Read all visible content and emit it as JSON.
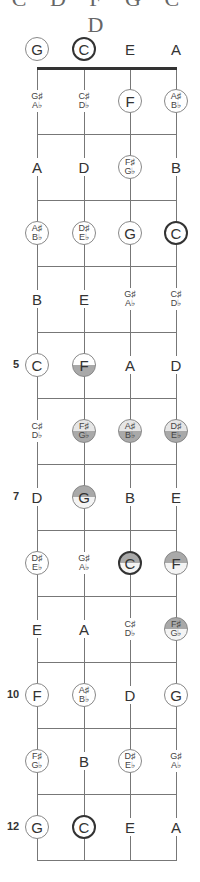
{
  "title": "C D F G C D",
  "tuning": [
    "G",
    "C",
    "E",
    "A"
  ],
  "strings_x": [
    37,
    84,
    130,
    176
  ],
  "nut_y": 68,
  "fret_spacing": 66,
  "fret_numbers": [
    {
      "fret": 5,
      "label": "5"
    },
    {
      "fret": 7,
      "label": "7"
    },
    {
      "fret": 10,
      "label": "10"
    },
    {
      "fret": 12,
      "label": "12"
    }
  ],
  "colors": {
    "line": "#777777",
    "nut": "#333333",
    "fill_dark": "#a9a9a9",
    "fill_light": "#e6e6e6"
  },
  "frets": [
    {
      "fret": 0,
      "notes": [
        {
          "top": "G",
          "circle": "thin",
          "fill": "none"
        },
        {
          "top": "C",
          "circle": "thick",
          "fill": "none"
        },
        {
          "top": "E",
          "circle": "none",
          "fill": "none"
        },
        {
          "top": "A",
          "circle": "none",
          "fill": "none"
        }
      ]
    },
    {
      "fret": 1,
      "notes": [
        {
          "top": "G♯",
          "bottom": "A♭",
          "circle": "none",
          "fill": "none"
        },
        {
          "top": "C♯",
          "bottom": "D♭",
          "circle": "none",
          "fill": "none"
        },
        {
          "top": "F",
          "circle": "thin",
          "fill": "none"
        },
        {
          "top": "A♯",
          "bottom": "B♭",
          "circle": "thin",
          "fill": "none"
        }
      ]
    },
    {
      "fret": 2,
      "notes": [
        {
          "top": "A",
          "circle": "none",
          "fill": "none"
        },
        {
          "top": "D",
          "circle": "none",
          "fill": "none"
        },
        {
          "top": "F♯",
          "bottom": "G♭",
          "circle": "thin",
          "fill": "none"
        },
        {
          "top": "B",
          "circle": "none",
          "fill": "none"
        }
      ]
    },
    {
      "fret": 3,
      "notes": [
        {
          "top": "A♯",
          "bottom": "B♭",
          "circle": "thin",
          "fill": "none"
        },
        {
          "top": "D♯",
          "bottom": "E♭",
          "circle": "thin",
          "fill": "none"
        },
        {
          "top": "G",
          "circle": "thin",
          "fill": "none"
        },
        {
          "top": "C",
          "circle": "thick",
          "fill": "none"
        }
      ]
    },
    {
      "fret": 4,
      "notes": [
        {
          "top": "B",
          "circle": "none",
          "fill": "none"
        },
        {
          "top": "E",
          "circle": "none",
          "fill": "none"
        },
        {
          "top": "G♯",
          "bottom": "A♭",
          "circle": "none",
          "fill": "none"
        },
        {
          "top": "C♯",
          "bottom": "D♭",
          "circle": "none",
          "fill": "none"
        }
      ]
    },
    {
      "fret": 5,
      "notes": [
        {
          "top": "C",
          "circle": "thin",
          "fill": "none"
        },
        {
          "top": "F",
          "circle": "thin",
          "fill": "bottom-half"
        },
        {
          "top": "A",
          "circle": "none",
          "fill": "none"
        },
        {
          "top": "D",
          "circle": "none",
          "fill": "none"
        }
      ]
    },
    {
      "fret": 6,
      "notes": [
        {
          "top": "C♯",
          "bottom": "D♭",
          "circle": "none",
          "fill": "none"
        },
        {
          "top": "F♯",
          "bottom": "G♭",
          "circle": "thin",
          "fill": "bottom-half"
        },
        {
          "top": "A♯",
          "bottom": "B♭",
          "circle": "thin",
          "fill": "bottom-half"
        },
        {
          "top": "D♯",
          "bottom": "E♭",
          "circle": "thin",
          "fill": "bottom-half"
        }
      ]
    },
    {
      "fret": 7,
      "notes": [
        {
          "top": "D",
          "circle": "none",
          "fill": "none"
        },
        {
          "top": "G",
          "circle": "thin",
          "fill": "top-half"
        },
        {
          "top": "B",
          "circle": "none",
          "fill": "none"
        },
        {
          "top": "E",
          "circle": "none",
          "fill": "none"
        }
      ]
    },
    {
      "fret": 8,
      "notes": [
        {
          "top": "D♯",
          "bottom": "E♭",
          "circle": "thin",
          "fill": "none"
        },
        {
          "top": "G♯",
          "bottom": "A♭",
          "circle": "none",
          "fill": "none"
        },
        {
          "top": "C",
          "circle": "thick",
          "fill": "top-half"
        },
        {
          "top": "F",
          "circle": "thin",
          "fill": "top-half"
        }
      ]
    },
    {
      "fret": 9,
      "notes": [
        {
          "top": "E",
          "circle": "none",
          "fill": "none"
        },
        {
          "top": "A",
          "circle": "none",
          "fill": "none"
        },
        {
          "top": "C♯",
          "bottom": "D♭",
          "circle": "none",
          "fill": "none"
        },
        {
          "top": "F♯",
          "bottom": "G♭",
          "circle": "thin",
          "fill": "top-half"
        }
      ]
    },
    {
      "fret": 10,
      "notes": [
        {
          "top": "F",
          "circle": "thin",
          "fill": "none"
        },
        {
          "top": "A♯",
          "bottom": "B♭",
          "circle": "thin",
          "fill": "none"
        },
        {
          "top": "D",
          "circle": "none",
          "fill": "none"
        },
        {
          "top": "G",
          "circle": "thin",
          "fill": "none"
        }
      ]
    },
    {
      "fret": 11,
      "notes": [
        {
          "top": "F♯",
          "bottom": "G♭",
          "circle": "thin",
          "fill": "none"
        },
        {
          "top": "B",
          "circle": "none",
          "fill": "none"
        },
        {
          "top": "D♯",
          "bottom": "E♭",
          "circle": "thin",
          "fill": "none"
        },
        {
          "top": "G♯",
          "bottom": "A♭",
          "circle": "none",
          "fill": "none"
        }
      ]
    },
    {
      "fret": 12,
      "notes": [
        {
          "top": "G",
          "circle": "thin",
          "fill": "none"
        },
        {
          "top": "C",
          "circle": "thick",
          "fill": "none"
        },
        {
          "top": "E",
          "circle": "none",
          "fill": "none"
        },
        {
          "top": "A",
          "circle": "none",
          "fill": "none"
        }
      ]
    }
  ]
}
